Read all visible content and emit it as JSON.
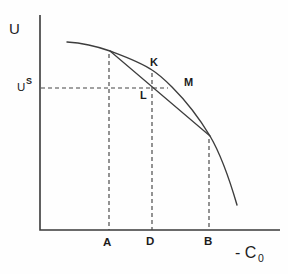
{
  "figure": {
    "background_color": "#fefefe",
    "line_color": "#3d3d3d",
    "text_color": "#1c1c1c"
  },
  "labels": {
    "y_axis": "U",
    "us_base": "U",
    "us_sup": "S",
    "point_k": "K",
    "point_m": "M",
    "point_l": "L",
    "tick_a": "A",
    "tick_d": "D",
    "tick_b": "B",
    "x_axis_main": "- C",
    "x_axis_sub": "0"
  },
  "geometry": {
    "axes_path": "M 40 15 V 230 H 280",
    "curve_path": "M 67 42 C 82 43 96 46 110 51 C 126 57 140 62 152 70 C 160 75 166 81 172 87 C 185 100 198 116 210 136 C 220 153 230 181 237 205",
    "chord_path": "M 110 51 L 210 136",
    "us_dash_path": "M 41 88 H 168",
    "a_dash_path": "M 109 54 V 230",
    "d_dash_path": "M 152 73 V 230",
    "b_dash_path": "M 209 139 V 230"
  },
  "chart_data": {
    "type": "line",
    "xlabel": "- C0",
    "ylabel": "U",
    "y_level_label": "US",
    "x_ticks": [
      "A",
      "D",
      "B"
    ],
    "series": [
      {
        "name": "concave utility curve",
        "points_px": [
          [
            67,
            42
          ],
          [
            110,
            51
          ],
          [
            152,
            70
          ],
          [
            172,
            87
          ],
          [
            210,
            136
          ],
          [
            237,
            205
          ]
        ]
      },
      {
        "name": "chord between curve points at A and B",
        "points_px": [
          [
            110,
            51
          ],
          [
            210,
            136
          ]
        ]
      }
    ],
    "point_labels": [
      {
        "label": "K",
        "pos_px": [
          152,
          70
        ]
      },
      {
        "label": "L",
        "pos_px": [
          152,
          87
        ]
      },
      {
        "label": "M",
        "pos_px": [
          172,
          87
        ]
      }
    ],
    "grid": false,
    "legend": false
  }
}
